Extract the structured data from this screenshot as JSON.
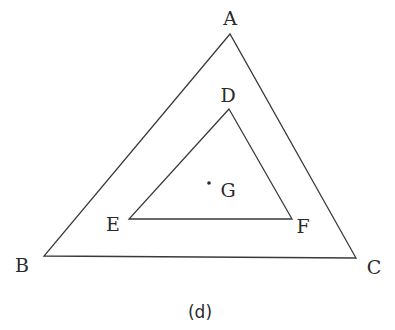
{
  "diagram": {
    "caption": "(d)",
    "stroke_color": "#3a3a3a",
    "text_color": "#2a2a2a",
    "outer_triangle": {
      "vertices": {
        "A": {
          "label": "A",
          "x": 230,
          "y": 34
        },
        "B": {
          "label": "B",
          "x": 44,
          "y": 256
        },
        "C": {
          "label": "C",
          "x": 356,
          "y": 258
        }
      }
    },
    "inner_triangle": {
      "vertices": {
        "D": {
          "label": "D",
          "x": 229,
          "y": 109
        },
        "E": {
          "label": "E",
          "x": 129,
          "y": 219
        },
        "F": {
          "label": "F",
          "x": 292,
          "y": 219
        }
      }
    },
    "point": {
      "G": {
        "label": "G",
        "x": 209,
        "y": 183
      }
    }
  }
}
